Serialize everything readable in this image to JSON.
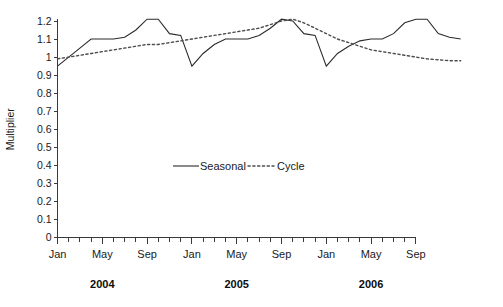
{
  "chart_data": {
    "type": "line",
    "title": "",
    "xlabel": "",
    "ylabel": "Multiplier",
    "ylim": [
      0,
      1.2
    ],
    "ytick_labels": [
      "0",
      "0.1",
      "0.2",
      "0.3",
      "0.4",
      "0.5",
      "0.6",
      "0.7",
      "0.8",
      "0.9",
      "1",
      "1.1",
      "1.2"
    ],
    "ytick_values": [
      0,
      0.1,
      0.2,
      0.3,
      0.4,
      0.5,
      0.6,
      0.7,
      0.8,
      0.9,
      1.0,
      1.1,
      1.2
    ],
    "grid": false,
    "legend_position": "center",
    "x_tick_count": 32,
    "x_labeled_ticks": [
      {
        "index": 0,
        "label": "Jan"
      },
      {
        "index": 4,
        "label": "May"
      },
      {
        "index": 8,
        "label": "Sep"
      },
      {
        "index": 12,
        "label": "Jan"
      },
      {
        "index": 16,
        "label": "May"
      },
      {
        "index": 20,
        "label": "Sep"
      },
      {
        "index": 24,
        "label": "Jan"
      },
      {
        "index": 28,
        "label": "May"
      },
      {
        "index": 32,
        "label": "Sep"
      }
    ],
    "x_group_labels": [
      {
        "label": "2004",
        "center_index": 4
      },
      {
        "label": "2005",
        "center_index": 16
      },
      {
        "label": "2006",
        "center_index": 28
      }
    ],
    "series": [
      {
        "name": "Seasonal",
        "style": "solid",
        "color": "#2b2b2b",
        "values": [
          0.95,
          1.0,
          1.05,
          1.1,
          1.1,
          1.1,
          1.11,
          1.15,
          1.21,
          1.21,
          1.13,
          1.12,
          0.95,
          1.02,
          1.07,
          1.1,
          1.1,
          1.1,
          1.12,
          1.16,
          1.21,
          1.2,
          1.13,
          1.12,
          0.95,
          1.02,
          1.06,
          1.09,
          1.1,
          1.1,
          1.13,
          1.19,
          1.21,
          1.21,
          1.13,
          1.11,
          1.1
        ]
      },
      {
        "name": "Cycle",
        "style": "dotted",
        "color": "#4d4d4d",
        "values": [
          0.99,
          1.0,
          1.01,
          1.02,
          1.03,
          1.04,
          1.05,
          1.06,
          1.07,
          1.07,
          1.08,
          1.09,
          1.1,
          1.11,
          1.12,
          1.13,
          1.14,
          1.15,
          1.16,
          1.18,
          1.2,
          1.21,
          1.19,
          1.16,
          1.13,
          1.1,
          1.08,
          1.06,
          1.04,
          1.03,
          1.02,
          1.01,
          1.0,
          0.99,
          0.985,
          0.98,
          0.98
        ]
      }
    ],
    "legend": [
      {
        "label": "Seasonal",
        "style": "solid"
      },
      {
        "label": "Cycle",
        "style": "dotted"
      }
    ]
  }
}
